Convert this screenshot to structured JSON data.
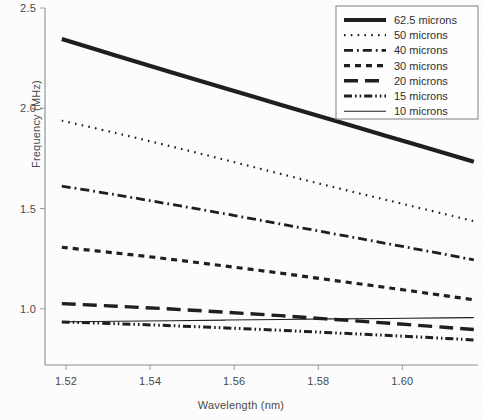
{
  "figure": {
    "name": "frequency-vs-wavelength-line-chart"
  },
  "axes": {
    "x": {
      "label": "Wavelength (nm)",
      "ticks": [
        "1.52",
        "1.54",
        "1.56",
        "1.58",
        "1.60"
      ],
      "tick_values": [
        1.52,
        1.54,
        1.56,
        1.58,
        1.6
      ],
      "min": 1.515,
      "max": 1.618
    },
    "y": {
      "label": "Frequency (MHz)",
      "ticks": [
        "2.5",
        "2.0",
        "1.5",
        "1.0"
      ],
      "tick_values": [
        2.5,
        2.0,
        1.5,
        1.0
      ],
      "min": 0.72,
      "max": 2.5
    }
  },
  "legend": {
    "position": "top-right",
    "entries": [
      {
        "label": "62.5 microns",
        "style": "thick-solid"
      },
      {
        "label": "50 microns",
        "style": "dotted"
      },
      {
        "label": "40 microns",
        "style": "dash-dot"
      },
      {
        "label": "30 microns",
        "style": "dashed-short"
      },
      {
        "label": "20 microns",
        "style": "dashed-long"
      },
      {
        "label": "15 microns",
        "style": "dash-dot-dot"
      },
      {
        "label": "10 microns",
        "style": "thin-solid"
      }
    ]
  },
  "colors": {
    "line": "#1f1f1f",
    "axis": "#8e8e8e",
    "text": "#4a4a4a",
    "background": "#ffffff"
  },
  "chart_data": {
    "type": "line",
    "title": "",
    "xlabel": "Wavelength (nm)",
    "ylabel": "Frequency (MHz)",
    "xlim": [
      1.515,
      1.618
    ],
    "ylim": [
      0.72,
      2.5
    ],
    "grid": false,
    "legend_position": "top-right",
    "x": [
      1.519,
      1.532,
      1.545,
      1.558,
      1.571,
      1.584,
      1.597,
      1.61,
      1.617
    ],
    "series": [
      {
        "name": "62.5 microns",
        "style": "thick-solid",
        "values": [
          2.345,
          2.262,
          2.18,
          2.099,
          2.018,
          1.938,
          1.857,
          1.777,
          1.733
        ]
      },
      {
        "name": "50 microns",
        "style": "dotted",
        "values": [
          1.938,
          1.876,
          1.81,
          1.742,
          1.673,
          1.605,
          1.539,
          1.473,
          1.437
        ]
      },
      {
        "name": "40 microns",
        "style": "dash-dot",
        "values": [
          1.612,
          1.568,
          1.521,
          1.473,
          1.423,
          1.373,
          1.323,
          1.272,
          1.244
        ]
      },
      {
        "name": "30 microns",
        "style": "dashed-short",
        "values": [
          1.307,
          1.278,
          1.247,
          1.213,
          1.178,
          1.141,
          1.104,
          1.066,
          1.045
        ]
      },
      {
        "name": "20 microns",
        "style": "dashed-long",
        "values": [
          1.026,
          1.013,
          0.999,
          0.983,
          0.966,
          0.947,
          0.928,
          0.908,
          0.897
        ]
      },
      {
        "name": "15 microns",
        "style": "dash-dot-dot",
        "values": [
          0.935,
          0.926,
          0.916,
          0.905,
          0.893,
          0.88,
          0.867,
          0.853,
          0.845
        ]
      },
      {
        "name": "10 microns",
        "style": "thin-solid",
        "values": [
          0.935,
          0.938,
          0.941,
          0.944,
          0.947,
          0.95,
          0.952,
          0.955,
          0.956
        ]
      }
    ]
  }
}
